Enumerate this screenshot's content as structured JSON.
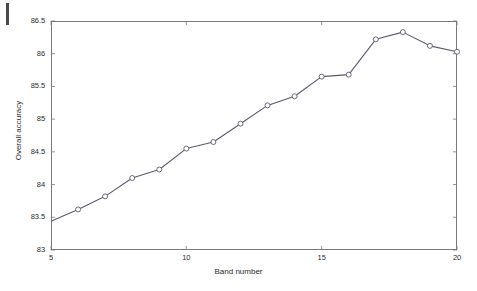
{
  "figure": {
    "background_color": "#ffffff",
    "line_color": "#5a5a6e",
    "axis_color": "#7a7a7a",
    "marker_face_color": "#ffffff"
  },
  "chart_data": {
    "type": "line",
    "title": "",
    "xlabel": "Band number",
    "ylabel": "Overall accuracy",
    "xlim": [
      5,
      20
    ],
    "ylim": [
      83,
      86.5
    ],
    "xticks": [
      5,
      10,
      15,
      20
    ],
    "xtick_labels": [
      "5",
      "10",
      "15",
      "20"
    ],
    "yticks": [
      83,
      83.5,
      84,
      84.5,
      85,
      85.5,
      86,
      86.5
    ],
    "ytick_labels": [
      "83",
      "83.5",
      "84",
      "84.5",
      "85",
      "85.5",
      "86",
      "86.5"
    ],
    "grid": false,
    "legend": null,
    "marker": "circle",
    "x": [
      5,
      6,
      7,
      8,
      9,
      10,
      11,
      12,
      13,
      14,
      15,
      16,
      17,
      18,
      19,
      20
    ],
    "values": [
      83.44,
      83.62,
      83.82,
      84.1,
      84.23,
      84.55,
      84.65,
      84.93,
      85.21,
      85.35,
      85.65,
      85.68,
      86.22,
      86.33,
      86.12,
      86.03
    ],
    "series": [
      {
        "name": "Overall accuracy",
        "values": [
          83.44,
          83.62,
          83.82,
          84.1,
          84.23,
          84.55,
          84.65,
          84.93,
          85.21,
          85.35,
          85.65,
          85.68,
          86.22,
          86.33,
          86.12,
          86.03
        ]
      }
    ]
  }
}
